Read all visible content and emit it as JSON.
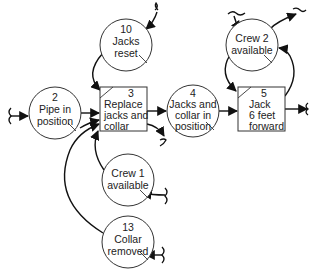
{
  "diagram": {
    "type": "activity-network",
    "nodes": {
      "c10": {
        "kind": "condition",
        "number": "10",
        "line1": "Jacks",
        "line2": "reset",
        "line3": ""
      },
      "c2": {
        "kind": "condition",
        "number": "2",
        "line1": "Pipe in",
        "line2": "position",
        "line3": ""
      },
      "a3": {
        "kind": "activity",
        "number": "3",
        "line1": "Replace",
        "line2": "jacks and",
        "line3": "collar"
      },
      "c4": {
        "kind": "condition",
        "number": "4",
        "line1": "Jacks and",
        "line2": "collar in",
        "line3": "position"
      },
      "crew2": {
        "kind": "condition",
        "number": "",
        "line1": "Crew 2",
        "line2": "available",
        "line3": ""
      },
      "a5": {
        "kind": "activity",
        "number": "5",
        "line1": "Jack",
        "line2": "6 feet",
        "line3": "forward"
      },
      "crew1": {
        "kind": "condition",
        "number": "",
        "line1": "Crew 1",
        "line2": "available",
        "line3": ""
      },
      "c13": {
        "kind": "condition",
        "number": "13",
        "line1": "Collar",
        "line2": "removed",
        "line3": ""
      }
    },
    "edges": [
      {
        "from": "external",
        "to": "c10"
      },
      {
        "from": "c10",
        "to": "a3"
      },
      {
        "from": "external",
        "to": "c2"
      },
      {
        "from": "c2",
        "to": "a3"
      },
      {
        "from": "crew1",
        "to": "a3"
      },
      {
        "from": "c13",
        "to": "a3"
      },
      {
        "from": "external",
        "to": "crew1"
      },
      {
        "from": "external",
        "to": "c13"
      },
      {
        "from": "a3",
        "to": "c4"
      },
      {
        "from": "a3",
        "to": "external"
      },
      {
        "from": "c4",
        "to": "a5"
      },
      {
        "from": "crew2",
        "to": "a5"
      },
      {
        "from": "a5",
        "to": "crew2"
      },
      {
        "from": "external",
        "to": "crew2"
      },
      {
        "from": "crew2",
        "to": "external"
      },
      {
        "from": "a5",
        "to": "external"
      }
    ],
    "colors": {
      "stroke": "#333333",
      "arrow": "#111111",
      "text": "#222222",
      "background": "#ffffff"
    }
  }
}
